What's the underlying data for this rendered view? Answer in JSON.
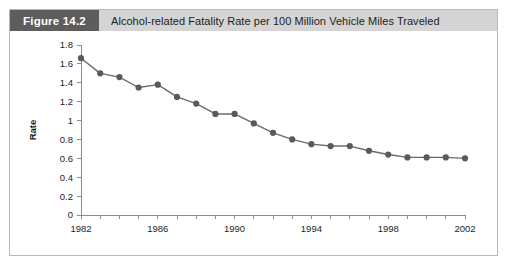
{
  "figure": {
    "tag": "Figure 14.2",
    "caption": "Alcohol-related Fatality Rate per 100 Million Vehicle Miles Traveled"
  },
  "colors": {
    "tag_background": "#5d5d5d",
    "header_background": "#d4d4d4",
    "frame_border": "#b9b9b9",
    "series": "#6a6a6a",
    "marker": "#5a5a5a",
    "axis": "#8c8c8c",
    "text": "#1d1d1d"
  },
  "chart_data": {
    "type": "line",
    "title": "Alcohol-related Fatality Rate per 100 Million Vehicle Miles Traveled",
    "xlabel": "",
    "ylabel": "Rate",
    "xlim": [
      1982,
      2002
    ],
    "ylim": [
      0,
      1.8
    ],
    "grid": false,
    "legend": false,
    "ytick_labels": [
      "0",
      "0.2",
      "0.4",
      "0.6",
      "0.8",
      "1",
      "1.2",
      "1.4",
      "1.6",
      "1.8"
    ],
    "ytick_values": [
      0,
      0.2,
      0.4,
      0.6,
      0.8,
      1,
      1.2,
      1.4,
      1.6,
      1.8
    ],
    "xtick_values": [
      1982,
      1983,
      1984,
      1985,
      1986,
      1987,
      1988,
      1989,
      1990,
      1991,
      1992,
      1993,
      1994,
      1995,
      1996,
      1997,
      1998,
      1999,
      2000,
      2001,
      2002
    ],
    "xtick_labels_shown": [
      "1982",
      "1986",
      "1990",
      "1994",
      "1998",
      "2002"
    ],
    "x": [
      1982,
      1983,
      1984,
      1985,
      1986,
      1987,
      1988,
      1989,
      1990,
      1991,
      1992,
      1993,
      1994,
      1995,
      1996,
      1997,
      1998,
      1999,
      2000,
      2001,
      2002
    ],
    "values": [
      1.66,
      1.5,
      1.46,
      1.35,
      1.38,
      1.25,
      1.18,
      1.07,
      1.07,
      0.97,
      0.87,
      0.8,
      0.75,
      0.73,
      0.73,
      0.68,
      0.64,
      0.61,
      0.61,
      0.61,
      0.6
    ],
    "series": [
      {
        "name": "Alcohol-related fatality rate",
        "values": [
          1.66,
          1.5,
          1.46,
          1.35,
          1.38,
          1.25,
          1.18,
          1.07,
          1.07,
          0.97,
          0.87,
          0.8,
          0.75,
          0.73,
          0.73,
          0.68,
          0.64,
          0.61,
          0.61,
          0.61,
          0.6
        ]
      }
    ]
  }
}
